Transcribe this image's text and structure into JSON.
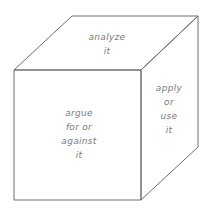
{
  "diagram": {
    "type": "cube",
    "faces": {
      "top": {
        "lines": [
          "analyze",
          "it"
        ]
      },
      "front": {
        "lines": [
          "argue",
          "for or",
          "against",
          "it"
        ]
      },
      "right": {
        "lines": [
          "apply",
          "or",
          "use",
          "it"
        ]
      }
    },
    "colors": {
      "stroke": "#6e6e6e",
      "text": "#7a7a7a",
      "background": "#ffffff"
    }
  }
}
